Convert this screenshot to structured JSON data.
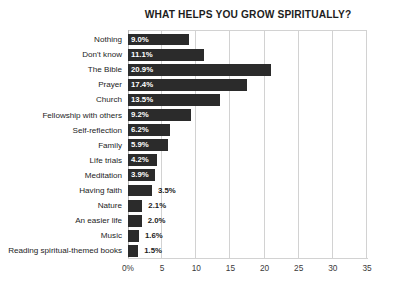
{
  "chart_data": {
    "type": "bar",
    "orientation": "horizontal",
    "title": "WHAT HELPS YOU GROW SPIRITUALLY?",
    "xlabel": "",
    "ylabel": "",
    "xlim": [
      0,
      35
    ],
    "grid": true,
    "legend": false,
    "bar_color": "#2b2b2b",
    "gridline_color": "#d2d2d2",
    "value_suffix": "%",
    "inside_label_threshold": 3.9,
    "tick_labels": [
      "0%",
      "5",
      "10",
      "15",
      "20",
      "25",
      "30",
      "35"
    ],
    "tick_values": [
      0,
      5,
      10,
      15,
      20,
      25,
      30,
      35
    ],
    "categories": [
      "Nothing",
      "Don't know",
      "The Bible",
      "Prayer",
      "Church",
      "Fellowship with others",
      "Self-reflection",
      "Family",
      "Life trials",
      "Meditation",
      "Having faith",
      "Nature",
      "An easier life",
      "Music",
      "Reading spiritual-themed books"
    ],
    "values": [
      9.0,
      11.1,
      20.9,
      17.4,
      13.5,
      9.2,
      6.2,
      5.9,
      4.2,
      3.9,
      3.5,
      2.1,
      2.0,
      1.6,
      1.5
    ],
    "value_labels": [
      "9.0%",
      "11.1%",
      "20.9%",
      "17.4%",
      "13.5%",
      "9.2%",
      "6.2%",
      "5.9%",
      "4.2%",
      "3.9%",
      "3.5%",
      "2.1%",
      "2.0%",
      "1.6%",
      "1.5%"
    ]
  }
}
